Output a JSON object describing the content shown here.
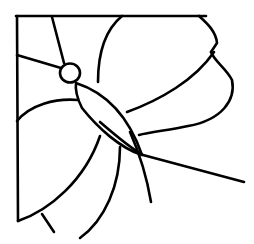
{
  "image": {
    "title": "Butterfly line drawing in corner frame",
    "subject": "butterfly",
    "style": "black outline line art on white",
    "stroke_color": "#000000",
    "background_color": "#ffffff",
    "stroke_width": 2.6
  },
  "elements": {
    "frame": "corner-frame",
    "head": "butterfly-head",
    "body": "butterfly-body",
    "antennae": [
      "antenna-left",
      "antenna-top"
    ],
    "wings": [
      "upper-right-wing",
      "lower-right-wing",
      "lower-left-wing",
      "left-wing"
    ],
    "legs": [
      "leg-tail"
    ]
  }
}
